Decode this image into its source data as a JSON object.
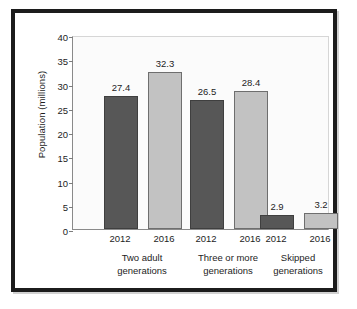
{
  "chart_data": {
    "type": "bar",
    "title": "",
    "subtitle": "",
    "xlabel": "",
    "ylabel": "Population (millions)",
    "ylim": [
      0,
      40
    ],
    "yticks": [
      0,
      5,
      10,
      15,
      20,
      25,
      30,
      35,
      40
    ],
    "ytick_labels": [
      "0",
      "5",
      "10",
      "15",
      "20",
      "25",
      "30",
      "35",
      "40"
    ],
    "grid": false,
    "legend": "none",
    "categories": [
      "Two adult generations",
      "Three or more generations",
      "Skipped generations"
    ],
    "category_lines": [
      [
        "Two adult",
        "generations"
      ],
      [
        "Three or more",
        "generations"
      ],
      [
        "Skipped",
        "generations"
      ]
    ],
    "series": [
      {
        "name": "2012",
        "color": "#575757",
        "values": [
          27.4,
          26.5,
          2.9
        ]
      },
      {
        "name": "2016",
        "color": "#c2c2c2",
        "values": [
          32.3,
          28.4,
          3.2
        ]
      }
    ],
    "bars": [
      {
        "group": "Two adult generations",
        "series": "2012",
        "value": 27.4,
        "label": "27.4",
        "style": "dark"
      },
      {
        "group": "Two adult generations",
        "series": "2016",
        "value": 32.3,
        "label": "32.3",
        "style": "light"
      },
      {
        "group": "Three or more generations",
        "series": "2012",
        "value": 26.5,
        "label": "26.5",
        "style": "dark"
      },
      {
        "group": "Three or more generations",
        "series": "2016",
        "value": 28.4,
        "label": "28.4",
        "style": "light"
      },
      {
        "group": "Skipped generations",
        "series": "2012",
        "value": 2.9,
        "label": "2.9",
        "style": "dark"
      },
      {
        "group": "Skipped generations",
        "series": "2016",
        "value": 3.2,
        "label": "3.2",
        "style": "light"
      }
    ]
  },
  "colors": {
    "series_2012": "#575757",
    "series_2016": "#c2c2c2",
    "frame": "#1c1c1c",
    "plot_background": "#fbfbfb",
    "axis": "#8a8a8a",
    "text": "#1d1d1d"
  }
}
